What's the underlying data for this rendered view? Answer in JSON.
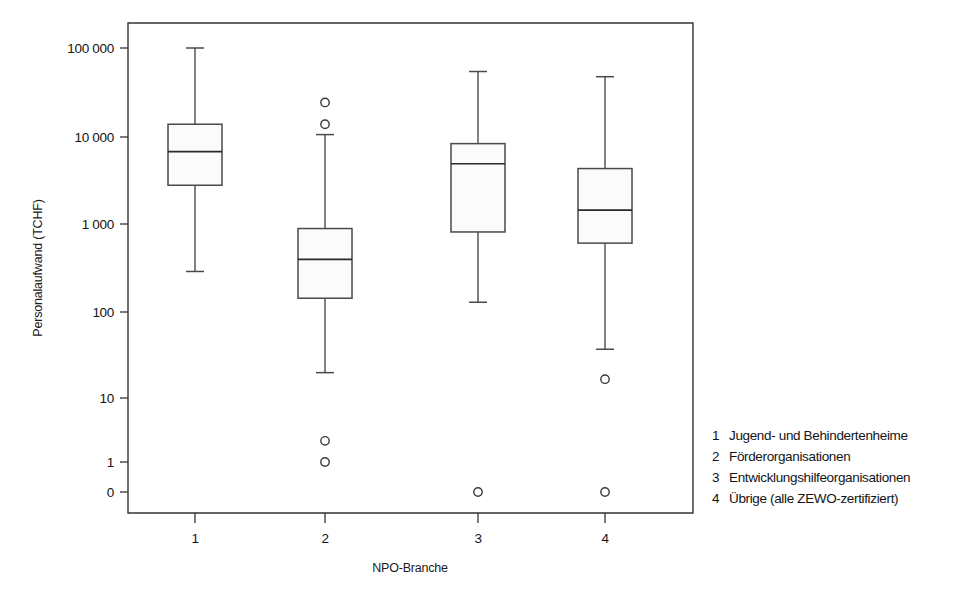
{
  "chart_data": {
    "type": "box",
    "title": "",
    "xlabel": "NPO-Branche",
    "ylabel": "Personalaufwand (TCHF)",
    "y_scale": "log",
    "y_ticks": [
      "0",
      "1",
      "10",
      "100",
      "1 000",
      "10 000",
      "100 000"
    ],
    "y_tick_values": [
      0,
      1,
      10,
      100,
      1000,
      10000,
      100000
    ],
    "x_ticks": [
      "1",
      "2",
      "3",
      "4"
    ],
    "grid": false,
    "legend_position": "right",
    "categories": [
      {
        "x_label": "1",
        "name": "Jugend- und Behindertenheime",
        "whisker_low": 200,
        "q1": 2200,
        "median": 5600,
        "q3": 12000,
        "whisker_high": 100000,
        "outliers": []
      },
      {
        "x_label": "2",
        "name": "Förderorganisationen",
        "whisker_low": 12,
        "q1": 95,
        "median": 280,
        "q3": 660,
        "whisker_high": 9000,
        "outliers": [
          22000,
          12000,
          1.8,
          1.0
        ]
      },
      {
        "x_label": "3",
        "name": "Entwicklungshilfeorganisationen",
        "whisker_low": 85,
        "q1": 600,
        "median": 4000,
        "q3": 7000,
        "whisker_high": 52000,
        "outliers": [
          0
        ]
      },
      {
        "x_label": "4",
        "name": "Übrige (alle ZEWO-zertifiziert)",
        "whisker_low": 23,
        "q1": 440,
        "median": 1100,
        "q3": 3500,
        "whisker_high": 45000,
        "outliers": [
          10,
          0
        ]
      }
    ]
  },
  "legend": {
    "items": [
      {
        "number": "1",
        "label": "Jugend- und Behindertenheime"
      },
      {
        "number": "2",
        "label": "Förderorganisationen"
      },
      {
        "number": "3",
        "label": "Entwicklungshilfeorganisationen"
      },
      {
        "number": "4",
        "label": "Übrige (alle ZEWO-zertifiziert)"
      }
    ]
  },
  "colors": {
    "box_fill": "#fbfbfb",
    "box_stroke": "#4a4a4a",
    "frame": "#333333",
    "text": "#141414",
    "background": "#ffffff"
  }
}
